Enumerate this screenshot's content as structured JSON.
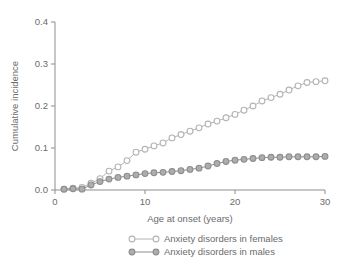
{
  "chart_data": {
    "type": "line",
    "title": "",
    "xlabel": "Age at onset (years)",
    "ylabel": "Cumulative incidence",
    "xlim": [
      0,
      30
    ],
    "ylim": [
      0,
      0.4
    ],
    "xticks": [
      "0",
      "10",
      "20",
      "30"
    ],
    "xtick_values": [
      0,
      10,
      20,
      30
    ],
    "yticks": [
      "0.0",
      "0.1",
      "0.2",
      "0.3",
      "0.4"
    ],
    "ytick_values": [
      0.0,
      0.1,
      0.2,
      0.3,
      0.4
    ],
    "grid": false,
    "legend_position": "below",
    "x": [
      1,
      2,
      3,
      4,
      5,
      6,
      7,
      8,
      9,
      10,
      11,
      12,
      13,
      14,
      15,
      16,
      17,
      18,
      19,
      20,
      21,
      22,
      23,
      24,
      25,
      26,
      27,
      28,
      29,
      30
    ],
    "series": [
      {
        "name": "Anxiety disorders in females",
        "color": "#b4b4b4",
        "marker": "open-circle",
        "values": [
          0.002,
          0.004,
          0.006,
          0.016,
          0.027,
          0.045,
          0.055,
          0.07,
          0.09,
          0.097,
          0.105,
          0.112,
          0.124,
          0.132,
          0.14,
          0.148,
          0.157,
          0.164,
          0.172,
          0.18,
          0.19,
          0.2,
          0.212,
          0.22,
          0.228,
          0.238,
          0.248,
          0.256,
          0.258,
          0.26
        ]
      },
      {
        "name": "Anxiety disorders in males",
        "color": "#8e8e8e",
        "marker": "filled-circle",
        "values": [
          0.002,
          0.003,
          0.002,
          0.012,
          0.02,
          0.026,
          0.03,
          0.033,
          0.036,
          0.039,
          0.041,
          0.042,
          0.044,
          0.046,
          0.049,
          0.052,
          0.057,
          0.063,
          0.068,
          0.071,
          0.073,
          0.075,
          0.077,
          0.078,
          0.078,
          0.079,
          0.079,
          0.079,
          0.079,
          0.08
        ]
      }
    ],
    "legend": [
      {
        "label": "Anxiety disorders in females",
        "color": "#b4b4b4",
        "marker": "open-circle"
      },
      {
        "label": "Anxiety disorders in males",
        "color": "#8e8e8e",
        "marker": "filled-circle"
      }
    ]
  }
}
